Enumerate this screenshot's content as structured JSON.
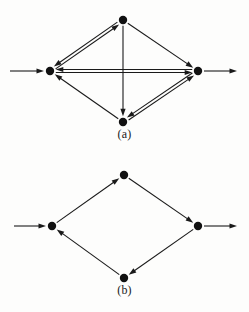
{
  "figure": {
    "width": 249,
    "height": 312,
    "background_color": "#fdfdfc",
    "ink_color": "#1a1a1a",
    "node_color": "#111111",
    "node_radius": 4.2,
    "edge_width": 1.1,
    "double_edge_gap": 3.0,
    "arrowhead_length": 7.5,
    "arrowhead_width": 5.2
  },
  "panels": [
    {
      "id": "a",
      "caption": "(a)",
      "description": "Diamond-shaped directed graph with four vertices; three of its six internal edges are bidirectional (drawn as double lines with arrowheads at both ends).",
      "nodes": [
        {
          "id": "top",
          "label": "top-vertex",
          "x": 123,
          "y": 20
        },
        {
          "id": "left",
          "label": "left-vertex",
          "x": 50,
          "y": 71
        },
        {
          "id": "right",
          "label": "right-vertex",
          "x": 198,
          "y": 71
        },
        {
          "id": "bottom",
          "label": "bottom-vertex",
          "x": 123,
          "y": 122
        }
      ],
      "edges": [
        {
          "id": "left-top",
          "from": "left",
          "to": "top",
          "style": "double",
          "direction": "bidirectional"
        },
        {
          "id": "left-right",
          "from": "left",
          "to": "right",
          "style": "double",
          "direction": "bidirectional"
        },
        {
          "id": "bottom-right",
          "from": "bottom",
          "to": "right",
          "style": "double",
          "direction": "bidirectional"
        },
        {
          "id": "top-right",
          "from": "top",
          "to": "right",
          "style": "single",
          "direction": "forward"
        },
        {
          "id": "bottom-left",
          "from": "bottom",
          "to": "left",
          "style": "single",
          "direction": "forward"
        },
        {
          "id": "top-bottom",
          "from": "top",
          "to": "bottom",
          "style": "single",
          "direction": "forward"
        }
      ],
      "external_arrows": [
        {
          "id": "entry-arrow",
          "label": "incoming-arrow",
          "x1": 10,
          "y1": 71,
          "x2": 44,
          "y2": 71
        },
        {
          "id": "exit-arrow",
          "label": "outgoing-arrow",
          "x1": 204,
          "y1": 71,
          "x2": 237,
          "y2": 71
        }
      ]
    },
    {
      "id": "b",
      "caption": "(b)",
      "description": "Diamond-shaped directed graph with four vertices forming a single directed cycle; all edges are single lines.",
      "nodes": [
        {
          "id": "top",
          "label": "top-vertex",
          "x": 124,
          "y": 19
        },
        {
          "id": "left",
          "label": "left-vertex",
          "x": 52,
          "y": 70
        },
        {
          "id": "right",
          "label": "right-vertex",
          "x": 198,
          "y": 70
        },
        {
          "id": "bottom",
          "label": "bottom-vertex",
          "x": 124,
          "y": 122
        }
      ],
      "edges": [
        {
          "id": "left-top",
          "from": "left",
          "to": "top",
          "style": "single",
          "direction": "forward"
        },
        {
          "id": "top-right",
          "from": "top",
          "to": "right",
          "style": "single",
          "direction": "forward"
        },
        {
          "id": "right-bottom",
          "from": "right",
          "to": "bottom",
          "style": "single",
          "direction": "forward"
        },
        {
          "id": "bottom-left",
          "from": "bottom",
          "to": "left",
          "style": "single",
          "direction": "forward"
        }
      ],
      "external_arrows": [
        {
          "id": "entry-arrow",
          "label": "incoming-arrow",
          "x1": 14,
          "y1": 70,
          "x2": 46,
          "y2": 70
        },
        {
          "id": "exit-arrow",
          "label": "outgoing-arrow",
          "x1": 204,
          "y1": 70,
          "x2": 237,
          "y2": 70
        }
      ]
    }
  ]
}
